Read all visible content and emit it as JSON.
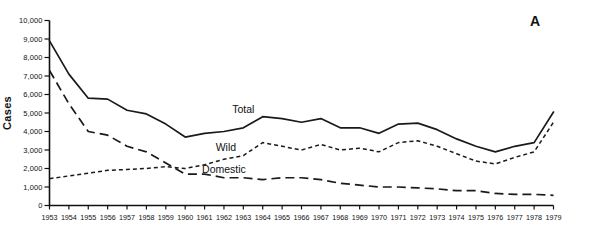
{
  "panel": {
    "label": "A"
  },
  "chart_data": {
    "type": "line",
    "title": "",
    "xlabel": "",
    "ylabel": "Cases",
    "ylim": [
      0,
      10000
    ],
    "ytick_labels": [
      "0",
      "1,000",
      "2,000",
      "3,000",
      "4,000",
      "5,000",
      "6,000",
      "7,000",
      "8,000",
      "9,000",
      "10,000"
    ],
    "ytick_values": [
      0,
      1000,
      2000,
      3000,
      4000,
      5000,
      6000,
      7000,
      8000,
      9000,
      10000
    ],
    "grid": false,
    "legend_position": "inline-labels",
    "categories": [
      "1953",
      "1954",
      "1955",
      "1956",
      "1957",
      "1958",
      "1959",
      "1960",
      "1961",
      "1962",
      "1963",
      "1964",
      "1965",
      "1966",
      "1967",
      "1968",
      "1969",
      "1970",
      "1971",
      "1972",
      "1973",
      "1974",
      "1975",
      "1976",
      "1977",
      "1978",
      "1979"
    ],
    "x": [
      1953,
      1954,
      1955,
      1956,
      1957,
      1958,
      1959,
      1960,
      1961,
      1962,
      1963,
      1964,
      1965,
      1966,
      1967,
      1968,
      1969,
      1970,
      1971,
      1972,
      1973,
      1974,
      1975,
      1976,
      1977,
      1978,
      1979
    ],
    "series": [
      {
        "name": "Total",
        "style": "solid",
        "values": [
          8900,
          7100,
          5800,
          5750,
          5150,
          4950,
          4400,
          3700,
          3900,
          4000,
          4200,
          4800,
          4700,
          4500,
          4700,
          4200,
          4200,
          3900,
          4400,
          4450,
          4100,
          3600,
          3200,
          2900,
          3200,
          3400,
          5050
        ]
      },
      {
        "name": "Wild",
        "style": "short-dash",
        "values": [
          1450,
          1600,
          1750,
          1900,
          1950,
          2000,
          2100,
          2000,
          2200,
          2500,
          2700,
          3400,
          3200,
          3000,
          3300,
          3000,
          3100,
          2900,
          3400,
          3500,
          3200,
          2800,
          2400,
          2250,
          2600,
          2900,
          4500
        ]
      },
      {
        "name": "Domestic",
        "style": "long-dash",
        "values": [
          7300,
          5500,
          4000,
          3800,
          3200,
          2900,
          2300,
          1700,
          1700,
          1500,
          1500,
          1400,
          1500,
          1500,
          1400,
          1200,
          1100,
          1000,
          1000,
          950,
          900,
          800,
          800,
          650,
          600,
          600,
          550
        ]
      }
    ],
    "series_label_positions": [
      {
        "name": "Total",
        "x": 1963.0,
        "y": 5000
      },
      {
        "name": "Wild",
        "x": 1962.1,
        "y": 2950
      },
      {
        "name": "Domestic",
        "x": 1962.0,
        "y": 1750
      }
    ]
  }
}
